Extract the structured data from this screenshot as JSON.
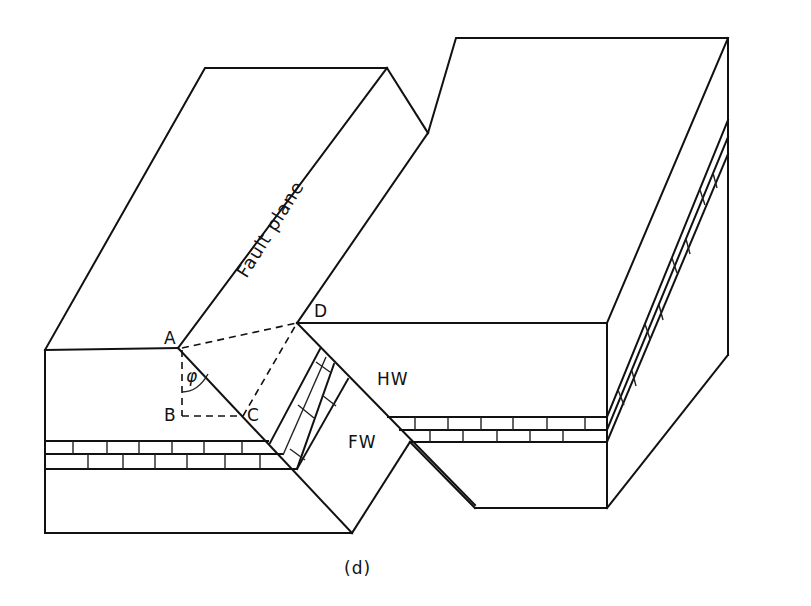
{
  "figure": {
    "caption": "(d)",
    "labels": {
      "fault_plane": "Fault plane",
      "point_a": "A",
      "point_b": "B",
      "point_c": "C",
      "point_d": "D",
      "angle": "φ",
      "hanging_wall": "HW",
      "footwall": "FW"
    },
    "colors": {
      "line": "#111111",
      "background": "#ffffff"
    }
  }
}
